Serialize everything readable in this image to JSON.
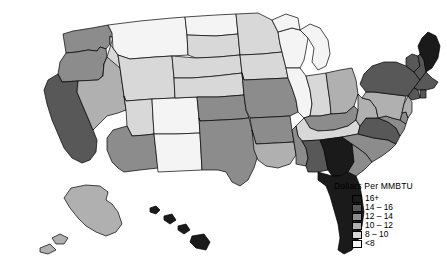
{
  "figure": {
    "type": "choropleth-map",
    "background_color": "#ffffff",
    "border_color": "#000000"
  },
  "legend": {
    "title": "Dollars Per MMBTU",
    "entries": [
      {
        "label": "16+",
        "color": "#1a1a1a"
      },
      {
        "label": "14 – 16",
        "color": "#585858"
      },
      {
        "label": "12 – 14",
        "color": "#8c8c8c"
      },
      {
        "label": "10 – 12",
        "color": "#b0b0b0"
      },
      {
        "label": "8 – 10",
        "color": "#d8d8d8"
      },
      {
        "label": "<8",
        "color": "#f4f4f4"
      }
    ]
  },
  "chart_data": {
    "type": "choropleth",
    "title": "Dollars Per MMBTU",
    "unit": "Dollars Per MMBTU",
    "bins": [
      "16+",
      "14 – 16",
      "12 – 14",
      "10 – 12",
      "8 – 10",
      "<8"
    ],
    "bin_colors": [
      "#1a1a1a",
      "#585858",
      "#8c8c8c",
      "#b0b0b0",
      "#d8d8d8",
      "#f4f4f4"
    ],
    "legend_position": "bottom-right",
    "regions": [
      {
        "name": "Washington",
        "abbr": "WA",
        "bin": "12 – 14",
        "color": "#8c8c8c"
      },
      {
        "name": "Oregon",
        "abbr": "OR",
        "bin": "12 – 14",
        "color": "#8c8c8c"
      },
      {
        "name": "California",
        "abbr": "CA",
        "bin": "14 – 16",
        "color": "#585858"
      },
      {
        "name": "Idaho",
        "abbr": "ID",
        "bin": "8 – 10",
        "color": "#d8d8d8"
      },
      {
        "name": "Nevada",
        "abbr": "NV",
        "bin": "10 – 12",
        "color": "#b0b0b0"
      },
      {
        "name": "Montana",
        "abbr": "MT",
        "bin": "<8",
        "color": "#f4f4f4"
      },
      {
        "name": "Wyoming",
        "abbr": "WY",
        "bin": "8 – 10",
        "color": "#d8d8d8"
      },
      {
        "name": "Utah",
        "abbr": "UT",
        "bin": "8 – 10",
        "color": "#d8d8d8"
      },
      {
        "name": "Arizona",
        "abbr": "AZ",
        "bin": "12 – 14",
        "color": "#8c8c8c"
      },
      {
        "name": "Colorado",
        "abbr": "CO",
        "bin": "<8",
        "color": "#f4f4f4"
      },
      {
        "name": "New Mexico",
        "abbr": "NM",
        "bin": "<8",
        "color": "#f4f4f4"
      },
      {
        "name": "North Dakota",
        "abbr": "ND",
        "bin": "<8",
        "color": "#f4f4f4"
      },
      {
        "name": "South Dakota",
        "abbr": "SD",
        "bin": "8 – 10",
        "color": "#d8d8d8"
      },
      {
        "name": "Nebraska",
        "abbr": "NE",
        "bin": "8 – 10",
        "color": "#d8d8d8"
      },
      {
        "name": "Kansas",
        "abbr": "KS",
        "bin": "8 – 10",
        "color": "#d8d8d8"
      },
      {
        "name": "Oklahoma",
        "abbr": "OK",
        "bin": "12 – 14",
        "color": "#8c8c8c"
      },
      {
        "name": "Texas",
        "abbr": "TX",
        "bin": "12 – 14",
        "color": "#8c8c8c"
      },
      {
        "name": "Minnesota",
        "abbr": "MN",
        "bin": "8 – 10",
        "color": "#d8d8d8"
      },
      {
        "name": "Iowa",
        "abbr": "IA",
        "bin": "8 – 10",
        "color": "#d8d8d8"
      },
      {
        "name": "Missouri",
        "abbr": "MO",
        "bin": "12 – 14",
        "color": "#8c8c8c"
      },
      {
        "name": "Arkansas",
        "abbr": "AR",
        "bin": "12 – 14",
        "color": "#8c8c8c"
      },
      {
        "name": "Louisiana",
        "abbr": "LA",
        "bin": "10 – 12",
        "color": "#b0b0b0"
      },
      {
        "name": "Wisconsin",
        "abbr": "WI",
        "bin": "<8",
        "color": "#f4f4f4"
      },
      {
        "name": "Illinois",
        "abbr": "IL",
        "bin": "<8",
        "color": "#f4f4f4"
      },
      {
        "name": "Michigan",
        "abbr": "MI",
        "bin": "<8",
        "color": "#f4f4f4"
      },
      {
        "name": "Indiana",
        "abbr": "IN",
        "bin": "8 – 10",
        "color": "#d8d8d8"
      },
      {
        "name": "Ohio",
        "abbr": "OH",
        "bin": "10 – 12",
        "color": "#b0b0b0"
      },
      {
        "name": "Kentucky",
        "abbr": "KY",
        "bin": "12 – 14",
        "color": "#8c8c8c"
      },
      {
        "name": "Tennessee",
        "abbr": "TN",
        "bin": "8 – 10",
        "color": "#d8d8d8"
      },
      {
        "name": "Mississippi",
        "abbr": "MS",
        "bin": "12 – 14",
        "color": "#8c8c8c"
      },
      {
        "name": "Alabama",
        "abbr": "AL",
        "bin": "14 – 16",
        "color": "#585858"
      },
      {
        "name": "Georgia",
        "abbr": "GA",
        "bin": "16+",
        "color": "#1a1a1a"
      },
      {
        "name": "Florida",
        "abbr": "FL",
        "bin": "16+",
        "color": "#1a1a1a"
      },
      {
        "name": "South Carolina",
        "abbr": "SC",
        "bin": "12 – 14",
        "color": "#8c8c8c"
      },
      {
        "name": "North Carolina",
        "abbr": "NC",
        "bin": "12 – 14",
        "color": "#8c8c8c"
      },
      {
        "name": "Virginia",
        "abbr": "VA",
        "bin": "14 – 16",
        "color": "#585858"
      },
      {
        "name": "West Virginia",
        "abbr": "WV",
        "bin": "10 – 12",
        "color": "#b0b0b0"
      },
      {
        "name": "Maryland",
        "abbr": "MD",
        "bin": "12 – 14",
        "color": "#8c8c8c"
      },
      {
        "name": "Delaware",
        "abbr": "DE",
        "bin": "12 – 14",
        "color": "#8c8c8c"
      },
      {
        "name": "Pennsylvania",
        "abbr": "PA",
        "bin": "10 – 12",
        "color": "#b0b0b0"
      },
      {
        "name": "New Jersey",
        "abbr": "NJ",
        "bin": "10 – 12",
        "color": "#b0b0b0"
      },
      {
        "name": "New York",
        "abbr": "NY",
        "bin": "14 – 16",
        "color": "#585858"
      },
      {
        "name": "Connecticut",
        "abbr": "CT",
        "bin": "14 – 16",
        "color": "#585858"
      },
      {
        "name": "Rhode Island",
        "abbr": "RI",
        "bin": "14 – 16",
        "color": "#585858"
      },
      {
        "name": "Massachusetts",
        "abbr": "MA",
        "bin": "14 – 16",
        "color": "#585858"
      },
      {
        "name": "Vermont",
        "abbr": "VT",
        "bin": "14 – 16",
        "color": "#585858"
      },
      {
        "name": "New Hampshire",
        "abbr": "NH",
        "bin": "14 – 16",
        "color": "#585858"
      },
      {
        "name": "Maine",
        "abbr": "ME",
        "bin": "16+",
        "color": "#1a1a1a"
      },
      {
        "name": "Alaska",
        "abbr": "AK",
        "bin": "10 – 12",
        "color": "#b0b0b0"
      },
      {
        "name": "Hawaii",
        "abbr": "HI",
        "bin": "16+",
        "color": "#1a1a1a"
      }
    ]
  }
}
